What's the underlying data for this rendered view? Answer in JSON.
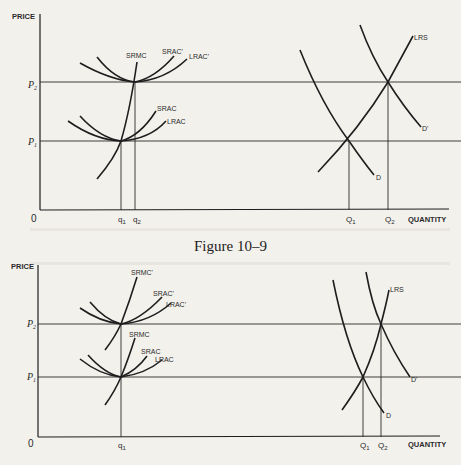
{
  "figure": {
    "caption": "Figure 10–9",
    "top_diagram": {
      "y_axis_label": "PRICE",
      "x_axis_label": "QUANTITY",
      "origin": "0",
      "price_levels": [
        {
          "label": "P",
          "sub": "2"
        },
        {
          "label": "P",
          "sub": "1"
        }
      ],
      "firm_quantities": [
        {
          "label": "q",
          "sub": "1"
        },
        {
          "label": "q",
          "sub": "2"
        }
      ],
      "market_quantities": [
        {
          "label": "Q",
          "sub": "1"
        },
        {
          "label": "Q",
          "sub": "2"
        }
      ],
      "curves": {
        "srmc": "SRMC",
        "srac_prime": "SRAC'",
        "lrac_prime": "LRAC'",
        "srac": "SRAC",
        "lrac": "LRAC",
        "lrs": "LRS",
        "d": "D",
        "d_prime": "D'"
      }
    },
    "bottom_diagram": {
      "y_axis_label": "PRICE",
      "x_axis_label": "QUANTITY",
      "origin": "0",
      "price_levels": [
        {
          "label": "P",
          "sub": "2"
        },
        {
          "label": "P",
          "sub": "1"
        }
      ],
      "firm_quantities": [
        {
          "label": "q",
          "sub": "1"
        }
      ],
      "market_quantities": [
        {
          "label": "Q",
          "sub": "1"
        },
        {
          "label": "Q",
          "sub": "2"
        }
      ],
      "curves": {
        "srmc_prime": "SRMC'",
        "srac_prime": "SRAC'",
        "lrac_prime": "LRAC'",
        "srmc": "SRMC",
        "srac": "SRAC",
        "lrac": "LRAC",
        "lrs": "LRS",
        "d": "D",
        "d_prime": "D'"
      }
    }
  }
}
